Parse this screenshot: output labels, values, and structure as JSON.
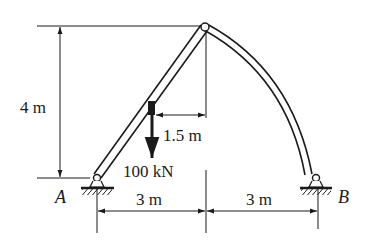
{
  "diagram": {
    "type": "three-hinged arch / frame",
    "labels": {
      "height": "4 m",
      "load_offset": "1.5 m",
      "load": "100 kN",
      "span_left": "3 m",
      "span_right": "3 m",
      "support_a": "A",
      "support_b": "B"
    },
    "members": [
      {
        "name": "straight-member-AC",
        "from": "A",
        "to": "C",
        "shape": "straight"
      },
      {
        "name": "curved-member-CB",
        "from": "C",
        "to": "B",
        "shape": "curved"
      }
    ],
    "supports": [
      {
        "name": "A",
        "type": "pin"
      },
      {
        "name": "B",
        "type": "pin"
      }
    ],
    "hinges": [
      "A",
      "C (apex)",
      "B"
    ],
    "loads": [
      {
        "magnitude": "100 kN",
        "direction": "downward",
        "horizontal_distance_from_apex": "1.5 m"
      }
    ],
    "colors": {
      "line": "#1a1a1a",
      "background": "#ffffff"
    }
  }
}
